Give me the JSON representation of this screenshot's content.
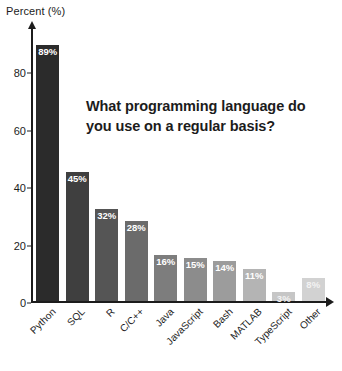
{
  "chart_data": {
    "type": "bar",
    "title": "What programming language do you use on a regular basis?",
    "xlabel": "",
    "ylabel": "Percent (%)",
    "ylim": [
      0,
      95
    ],
    "yticks": [
      0,
      20,
      40,
      60,
      80
    ],
    "grid": false,
    "legend": "none",
    "categories": [
      "Python",
      "SQL",
      "R",
      "C/C++",
      "Java",
      "JavaScript",
      "Bash",
      "MATLAB",
      "TypeScript",
      "Other"
    ],
    "values": [
      89,
      45,
      32,
      28,
      16,
      15,
      14,
      11,
      3,
      8
    ],
    "value_labels": [
      "89%",
      "45%",
      "32%",
      "28%",
      "16%",
      "15%",
      "14%",
      "11%",
      "3%",
      "8%"
    ],
    "bar_colors": [
      "#2b2b2b",
      "#3f3f3f",
      "#555555",
      "#6b6b6b",
      "#7d7d7d",
      "#8c8c8c",
      "#9c9c9c",
      "#b4b4b4",
      "#c6c6c6",
      "#d2d2d2"
    ],
    "axis_color": "#1c1c1c",
    "background": "#ffffff",
    "value_label_color": "#ffffff"
  },
  "axis": {
    "y_title": "Percent (%)",
    "tick_0": "0",
    "tick_1": "20",
    "tick_2": "40",
    "tick_3": "60",
    "tick_4": "80"
  },
  "headline": {
    "text": "What programming language do you use on a regular basis?"
  }
}
